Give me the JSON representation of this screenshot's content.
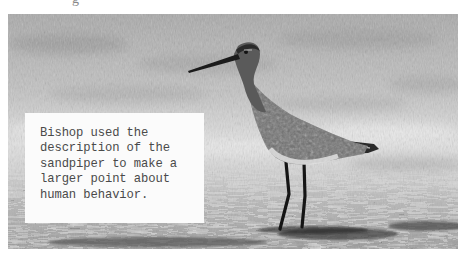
{
  "image": {
    "description": "Grayscale photograph of a sandpiper standing on wet sand/shallow water",
    "subject": "sandpiper",
    "tone": "grayscale"
  },
  "caption": {
    "lines": [
      "Bishop used the",
      "description of the",
      "sandpiper to make a",
      "larger point about",
      "human behavior."
    ],
    "text": "Bishop used the\ndescription of the\nsandpiper to make a\nlarger point about\nhuman behavior."
  },
  "top_fragment": "g",
  "colors": {
    "page_bg": "#ffffff",
    "caption_bg": "#fbfbfb",
    "caption_text": "#4a4a4a",
    "bird_dark": "#1e1e1e"
  }
}
